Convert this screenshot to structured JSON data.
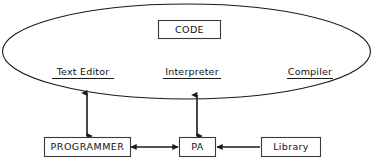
{
  "diagram": {
    "type": "block-diagram",
    "background_color": "#ffffff",
    "line_color": "#1a1a1a",
    "box_stroke_color": "#3a3a3a",
    "text_color": "#111111",
    "environment": {
      "shape": "ellipse",
      "label": "",
      "code_box": {
        "label": "CODE",
        "shape": "rectangle"
      },
      "tools": [
        {
          "label": "Text Editor",
          "underlined": true
        },
        {
          "label": "Interpreter",
          "underlined": true
        },
        {
          "label": "Compiler",
          "underlined": true
        }
      ]
    },
    "actors": [
      {
        "id": "programmer",
        "label": "PROGRAMMER",
        "shape": "rectangle"
      },
      {
        "id": "pa",
        "label": "PA",
        "shape": "rectangle"
      },
      {
        "id": "library",
        "label": "Library",
        "shape": "rectangle"
      }
    ],
    "connections": [
      {
        "from": "environment",
        "to": "programmer",
        "orientation": "vertical",
        "arrows": "both"
      },
      {
        "from": "environment",
        "to": "pa",
        "orientation": "vertical",
        "arrows": "both"
      },
      {
        "from": "programmer",
        "to": "pa",
        "orientation": "horizontal",
        "arrows": "both"
      },
      {
        "from": "library",
        "to": "pa",
        "orientation": "horizontal",
        "arrows": "single-left"
      }
    ]
  }
}
